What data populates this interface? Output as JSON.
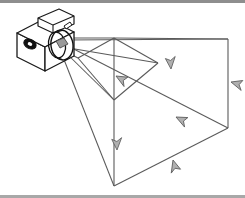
{
  "figure": {
    "title": "Camera view frustum projection diagram",
    "background_color": "#ffffff",
    "border_color": "#8e8e8e",
    "frustum_line_color": "#5a5a5a",
    "camera_line_color": "#1a1a1a",
    "arrow_fill_color": "#b0b0b0",
    "arrow_stroke_color": "#5a5a5a",
    "lens_fill_color": "#9a9a9a"
  },
  "camera": {
    "label": "camera",
    "body": {
      "front_face": [
        [
          17,
          33
        ],
        [
          45,
          19
        ],
        [
          72,
          33
        ],
        [
          72,
          56
        ],
        [
          45,
          71
        ],
        [
          17,
          56
        ]
      ],
      "top_face": [
        [
          17,
          33
        ],
        [
          45,
          19
        ],
        [
          72,
          33
        ],
        [
          45,
          47
        ]
      ],
      "side_face": [
        [
          45,
          47
        ],
        [
          72,
          33
        ],
        [
          72,
          56
        ],
        [
          45,
          71
        ]
      ],
      "left_face": [
        [
          17,
          33
        ],
        [
          45,
          47
        ],
        [
          45,
          71
        ],
        [
          17,
          56
        ]
      ]
    },
    "viewfinder_button": {
      "center": [
        31,
        41
      ],
      "rx": 6,
      "ry": 4
    },
    "top_housing": {
      "points": [
        [
          37,
          19
        ],
        [
          58,
          11
        ],
        [
          72,
          18
        ],
        [
          72,
          26
        ],
        [
          51,
          34
        ],
        [
          37,
          27
        ]
      ]
    },
    "lens": {
      "center": [
        60,
        45
      ],
      "outer_rx": 11,
      "outer_ry": 14,
      "inner_rx": 7,
      "inner_ry": 9,
      "hub_size": 6
    }
  },
  "frustum": {
    "apex": [
      62,
      45
    ],
    "near_plane": {
      "label": "near plane",
      "points": [
        [
          76,
          56
        ],
        [
          115,
          41
        ],
        [
          160,
          63
        ],
        [
          112,
          84
        ]
      ]
    },
    "far_plane": {
      "label": "far plane",
      "points": [
        [
          114,
          38
        ],
        [
          228,
          39
        ],
        [
          228,
          128
        ],
        [
          114,
          133
        ]
      ]
    },
    "rays": [
      {
        "name": "ray-top",
        "from": [
          62,
          45
        ],
        "to": [
          228,
          39
        ]
      },
      {
        "name": "ray-upper",
        "from": [
          62,
          45
        ],
        "to": [
          228,
          39
        ]
      },
      {
        "name": "ray-mid",
        "from": [
          62,
          45
        ],
        "to": [
          114,
          38
        ]
      },
      {
        "name": "ray-lower",
        "from": [
          62,
          45
        ],
        "to": [
          228,
          128
        ]
      },
      {
        "name": "ray-bottom",
        "from": [
          62,
          45
        ],
        "to": [
          114,
          186
        ]
      }
    ]
  },
  "arrows": [
    {
      "name": "arrow-near-diagonal",
      "position": [
        115,
        73
      ],
      "direction": "right-down",
      "rotation": 24
    },
    {
      "name": "arrow-far-top-edge",
      "position": [
        170,
        66
      ],
      "direction": "up-left",
      "rotation": -68
    },
    {
      "name": "arrow-far-right-edge",
      "position": [
        230,
        78
      ],
      "direction": "down",
      "rotation": 8
    },
    {
      "name": "arrow-center-ray",
      "position": [
        172,
        113
      ],
      "direction": "right-down",
      "rotation": 28
    },
    {
      "name": "arrow-mid-vertical",
      "position": [
        116,
        146
      ],
      "direction": "up",
      "rotation": -6
    },
    {
      "name": "arrow-far-bottom",
      "position": [
        172,
        156
      ],
      "direction": "down-right",
      "rotation": 16
    }
  ],
  "icons": {
    "camera": "camera-icon",
    "lens": "lens-icon",
    "arrow": "arrowhead-icon"
  }
}
